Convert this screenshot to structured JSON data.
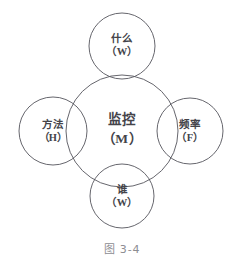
{
  "figure": {
    "caption": "图 3-4",
    "type": "overlapping-circles-diagram",
    "stroke_color": "#55555c",
    "text_color": "#44444a",
    "caption_color": "#8d8d92",
    "background_color": "#ffffff"
  },
  "nodes": {
    "center": {
      "cn": "监控",
      "en": "（M）",
      "role": "monitoring",
      "cx": 122,
      "cy": 131,
      "r": 56
    },
    "top": {
      "cn": "什么",
      "en": "（W）",
      "role": "what",
      "cx": 122,
      "cy": 46,
      "r": 33
    },
    "right": {
      "cn": "频率",
      "en": "（F）",
      "role": "frequency",
      "cx": 190,
      "cy": 131,
      "r": 33
    },
    "bottom": {
      "cn": "谁",
      "en": "（W）",
      "role": "who",
      "cx": 122,
      "cy": 196,
      "r": 32
    },
    "left": {
      "cn": "方法",
      "en": "（H）",
      "role": "how",
      "cx": 53,
      "cy": 131,
      "r": 34
    }
  }
}
